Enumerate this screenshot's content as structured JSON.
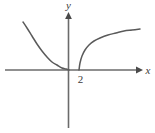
{
  "figure": {
    "background_color": "#ffffff",
    "axis_color": "#6b6b6b",
    "curve_color": "#5a5a5a",
    "label_color": "#3a3a3a",
    "y_axis_label": "y",
    "x_axis_label": "x",
    "tick_label_2": "2"
  },
  "chart_data": {
    "type": "line",
    "title": "",
    "xlabel": "x",
    "ylabel": "y",
    "grid": false,
    "legend": null,
    "axis_origin_px": {
      "x": 68,
      "y": 70
    },
    "x_axis_span_px": [
      5,
      140
    ],
    "y_axis_span_px": [
      15,
      128
    ],
    "x_axis_arrow": "right",
    "y_axis_arrow": "up",
    "annotations": [
      {
        "text": "2",
        "x_px": 80,
        "y_px": 82,
        "describes": "x-intercept of right branch"
      }
    ],
    "series": [
      {
        "name": "left-branch",
        "description": "decreasing convex curve falling from upper left, asymptotic to the x-axis from above as x increases toward 0",
        "points_px": [
          [
            23,
            22
          ],
          [
            27,
            28
          ],
          [
            32,
            36
          ],
          [
            37,
            44
          ],
          [
            42,
            51
          ],
          [
            47,
            57
          ],
          [
            52,
            62
          ],
          [
            57,
            65
          ],
          [
            62,
            68
          ],
          [
            66,
            69
          ],
          [
            69,
            70
          ]
        ]
      },
      {
        "name": "right-branch",
        "description": "increasing concave curve rising steeply from the x-axis at x = 2 then flattening toward upper right",
        "points_px": [
          [
            79,
            70
          ],
          [
            80,
            63
          ],
          [
            82,
            56
          ],
          [
            85,
            50
          ],
          [
            89,
            45
          ],
          [
            94,
            41
          ],
          [
            100,
            38
          ],
          [
            108,
            35
          ],
          [
            116,
            33
          ],
          [
            124,
            31
          ],
          [
            132,
            30
          ],
          [
            140,
            29
          ]
        ]
      }
    ]
  }
}
